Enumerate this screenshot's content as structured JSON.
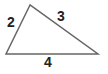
{
  "diagram": {
    "type": "triangle",
    "vertices": {
      "top": [
        30,
        5
      ],
      "bottom_left": [
        6,
        54
      ],
      "bottom_right": [
        98,
        54
      ]
    },
    "sides": [
      {
        "id": "left",
        "label": "2"
      },
      {
        "id": "right",
        "label": "3"
      },
      {
        "id": "bottom",
        "label": "4"
      }
    ],
    "stroke_color": "#666666"
  }
}
